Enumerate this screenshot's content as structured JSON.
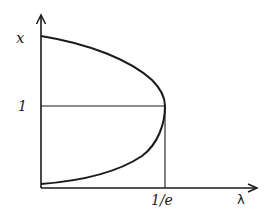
{
  "diagram": {
    "axes": {
      "y_label": "x",
      "x_label": "λ"
    },
    "ticks": {
      "y_marker": "1",
      "x_marker": "1/e"
    },
    "curve": {
      "description": "Two branches of x as a function of λ meeting at λ = 1/e, x = 1",
      "upper_branch": "starts high on the x-axis at λ = 0 and decreases to x = 1 at λ = 1/e",
      "lower_branch": "starts near x = 0 at λ = 0 and increases to x = 1 at λ = 1/e"
    },
    "guide_lines": [
      "horizontal line at x = 1 from the vertical axis to λ = 1/e",
      "vertical line at λ = 1/e from the curve tip down to the λ axis"
    ],
    "colors": {
      "ink": "#1a1a1a",
      "background": "#ffffff"
    }
  }
}
